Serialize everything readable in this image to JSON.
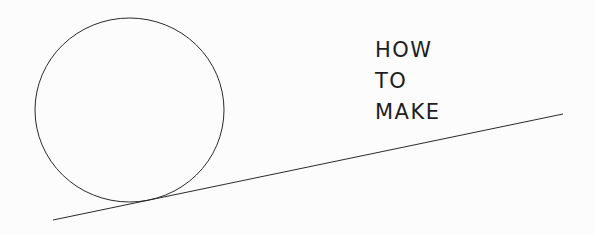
{
  "title": {
    "lines": [
      "HOW",
      "TO",
      "MAKE"
    ]
  },
  "colors": {
    "background": "#fcfcfc",
    "stroke": "#2a2a2a",
    "text": "#1e1e1e"
  }
}
